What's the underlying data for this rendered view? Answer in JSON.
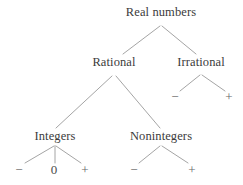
{
  "diagram": {
    "type": "tree",
    "background_color": "#ffffff",
    "edge_color": "#9a9a9a",
    "text_color": "#3b3b3b",
    "sign_color": "#666666",
    "nodes": [
      {
        "id": "real",
        "label": "Real numbers",
        "x": 161,
        "y": 12,
        "kind": "label"
      },
      {
        "id": "rational",
        "label": "Rational",
        "x": 114,
        "y": 62,
        "kind": "label"
      },
      {
        "id": "irrational",
        "label": "Irrational",
        "x": 201,
        "y": 62,
        "kind": "label"
      },
      {
        "id": "integers",
        "label": "Integers",
        "x": 55,
        "y": 136,
        "kind": "label"
      },
      {
        "id": "nonintegers",
        "label": "Nonintegers",
        "x": 161,
        "y": 136,
        "kind": "label"
      },
      {
        "id": "irr-neg",
        "label": "−",
        "x": 175,
        "y": 96,
        "kind": "sign"
      },
      {
        "id": "irr-pos",
        "label": "+",
        "x": 229,
        "y": 96,
        "kind": "sign"
      },
      {
        "id": "int-neg",
        "label": "−",
        "x": 19,
        "y": 169,
        "kind": "sign"
      },
      {
        "id": "int-zero",
        "label": "0",
        "x": 54,
        "y": 169,
        "kind": "zero"
      },
      {
        "id": "int-pos",
        "label": "+",
        "x": 85,
        "y": 169,
        "kind": "sign"
      },
      {
        "id": "non-neg",
        "label": "−",
        "x": 134,
        "y": 169,
        "kind": "sign"
      },
      {
        "id": "non-pos",
        "label": "+",
        "x": 192,
        "y": 169,
        "kind": "sign"
      }
    ],
    "edges": [
      {
        "id": "real-rational",
        "from": "real",
        "to": "rational",
        "x1": 160,
        "y1": 26,
        "x2": 123,
        "y2": 54
      },
      {
        "id": "real-irrational",
        "from": "real",
        "to": "irrational",
        "x1": 162,
        "y1": 26,
        "x2": 196,
        "y2": 54
      },
      {
        "id": "rational-integers",
        "from": "rational",
        "to": "integers",
        "x1": 112,
        "y1": 76,
        "x2": 56,
        "y2": 128
      },
      {
        "id": "rational-noninteger",
        "from": "rational",
        "to": "nonintegers",
        "x1": 116,
        "y1": 76,
        "x2": 160,
        "y2": 128
      },
      {
        "id": "irrational-neg",
        "from": "irrational",
        "to": "irr-neg",
        "x1": 200,
        "y1": 75,
        "x2": 180,
        "y2": 91
      },
      {
        "id": "irrational-pos",
        "from": "irrational",
        "to": "irr-pos",
        "x1": 202,
        "y1": 75,
        "x2": 225,
        "y2": 91
      },
      {
        "id": "integers-neg",
        "from": "integers",
        "to": "int-neg",
        "x1": 54,
        "y1": 146,
        "x2": 25,
        "y2": 163
      },
      {
        "id": "integers-zero",
        "from": "integers",
        "to": "int-zero",
        "x1": 55,
        "y1": 146,
        "x2": 55,
        "y2": 163
      },
      {
        "id": "integers-pos",
        "from": "integers",
        "to": "int-pos",
        "x1": 56,
        "y1": 146,
        "x2": 81,
        "y2": 163
      },
      {
        "id": "nonintegers-neg",
        "from": "nonintegers",
        "to": "non-neg",
        "x1": 160,
        "y1": 146,
        "x2": 139,
        "y2": 163
      },
      {
        "id": "nonintegers-pos",
        "from": "nonintegers",
        "to": "non-pos",
        "x1": 162,
        "y1": 146,
        "x2": 188,
        "y2": 163
      }
    ]
  }
}
